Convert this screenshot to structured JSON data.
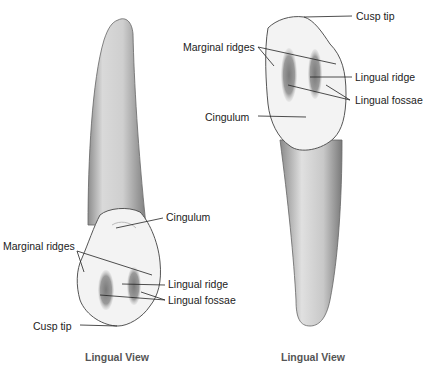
{
  "left_figure": {
    "caption": "Lingual View",
    "labels": {
      "cingulum": "Cingulum",
      "marginal_ridges": "Marginal ridges",
      "lingual_ridge": "Lingual ridge",
      "lingual_fossae": "Lingual fossae",
      "cusp_tip": "Cusp tip"
    },
    "orientation": "crown-down"
  },
  "right_figure": {
    "caption": "Lingual View",
    "labels": {
      "cusp_tip": "Cusp tip",
      "marginal_ridges": "Marginal ridges",
      "lingual_ridge": "Lingual ridge",
      "lingual_fossae": "Lingual fossae",
      "cingulum": "Cingulum"
    },
    "orientation": "crown-up"
  },
  "colors": {
    "outline": "#555555",
    "root_shade": "#b5b5b5",
    "crown_fill": "#f4f4f4",
    "fossa_shade": "#8a8a8a",
    "leader": "#222222"
  }
}
